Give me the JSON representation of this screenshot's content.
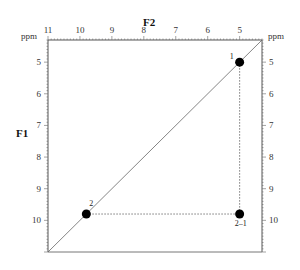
{
  "chart_data": {
    "type": "scatter",
    "title": "",
    "xlabel": "F2",
    "ylabel": "F1",
    "x_unit": "ppm",
    "y_unit": "ppm",
    "xlim": [
      11,
      4.3
    ],
    "ylim": [
      4.3,
      11
    ],
    "x_reversed": true,
    "x_ticks": [
      11,
      10,
      9,
      8,
      7,
      6,
      5
    ],
    "y_ticks": [
      5,
      6,
      7,
      8,
      9,
      10
    ],
    "grid": false,
    "diagonal": true,
    "points": [
      {
        "label": "1",
        "x": 5.0,
        "y": 5.0
      },
      {
        "label": "2",
        "x": 9.8,
        "y": 9.8
      },
      {
        "label": "2–1",
        "x": 5.0,
        "y": 9.8
      }
    ],
    "guides": [
      {
        "from": "1",
        "to": "2–1",
        "style": "dotted"
      },
      {
        "from": "2",
        "to": "2–1",
        "style": "dotted"
      }
    ]
  },
  "labels": {
    "x_unit_left": "ppm",
    "x_unit_right": "ppm",
    "f2": "F2",
    "f1": "F1"
  }
}
